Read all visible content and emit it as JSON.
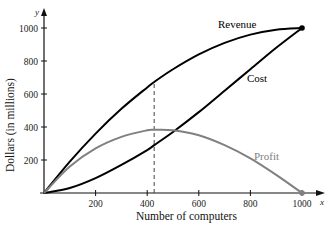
{
  "chart_data": {
    "type": "line",
    "title": "",
    "xlabel": "Number of computers",
    "ylabel": "Dollars (in millions)",
    "x_axis_var": "x",
    "y_axis_var": "y",
    "xlim": [
      0,
      1000
    ],
    "ylim": [
      0,
      1000
    ],
    "x_ticks": [
      200,
      400,
      600,
      800,
      1000
    ],
    "y_ticks": [
      200,
      400,
      600,
      800,
      1000
    ],
    "grid": false,
    "legend": "inline labels",
    "x": [
      0,
      100,
      200,
      300,
      400,
      427,
      500,
      600,
      700,
      800,
      900,
      1000
    ],
    "series": [
      {
        "name": "Revenue",
        "color": "#000000",
        "values": [
          0,
          190,
          360,
          510,
          640,
          673,
          750,
          840,
          910,
          960,
          990,
          1000
        ]
      },
      {
        "name": "Cost",
        "color": "#000000",
        "values": [
          0,
          30,
          90,
          170,
          260,
          290,
          370,
          490,
          620,
          750,
          880,
          1000
        ]
      },
      {
        "name": "Profit",
        "color": "#808080",
        "values": [
          0,
          160,
          270,
          340,
          380,
          383,
          380,
          350,
          290,
          210,
          110,
          0
        ]
      }
    ],
    "annotations": [
      {
        "type": "vertical-dashed-line",
        "x": 427,
        "from_y": 0,
        "to_y": 673,
        "note": "maximum profit"
      },
      {
        "type": "point",
        "x": 1000,
        "y": 1000,
        "label": "Revenue = Cost"
      },
      {
        "type": "point",
        "x": 1000,
        "y": 0,
        "label": "Profit = 0"
      }
    ]
  },
  "labels": {
    "revenue": "Revenue",
    "cost": "Cost",
    "profit": "Profit",
    "xlabel": "Number of computers",
    "ylabel": "Dollars (in millions)",
    "x_var": "x",
    "y_var": "y",
    "xticks": [
      "200",
      "400",
      "600",
      "800",
      "1000"
    ],
    "yticks": [
      "200",
      "400",
      "600",
      "800",
      "1000"
    ]
  }
}
